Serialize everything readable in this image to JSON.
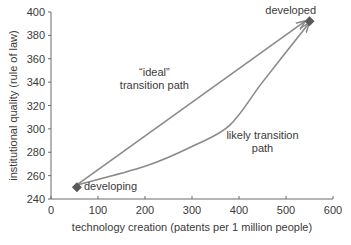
{
  "chart_data": {
    "type": "line",
    "title": "",
    "xlabel": "technology creation (patents per 1 million people)",
    "ylabel": "institutional quality (rule of law)",
    "xlim": [
      0,
      600
    ],
    "ylim": [
      240,
      400
    ],
    "x_ticks": [
      0,
      100,
      200,
      300,
      400,
      500,
      600
    ],
    "y_ticks": [
      240,
      260,
      280,
      300,
      320,
      340,
      360,
      380,
      400
    ],
    "grid": false,
    "legend": null,
    "points": [
      {
        "name": "developing",
        "x": 55,
        "y": 250
      },
      {
        "name": "developed",
        "x": 550,
        "y": 392
      }
    ],
    "series": [
      {
        "name": "“ideal” transition path",
        "style": "straight arrow",
        "x": [
          55,
          540
        ],
        "y": [
          252,
          392
        ]
      },
      {
        "name": "likely transition path",
        "style": "curved arrow",
        "x": [
          55,
          200,
          300,
          380,
          450,
          548
        ],
        "y": [
          252,
          268,
          285,
          303,
          340,
          390
        ]
      }
    ],
    "annotations": [
      {
        "text": "“ideal”",
        "x": 220,
        "y": 345
      },
      {
        "text": "transition path",
        "x": 220,
        "y": 334
      },
      {
        "text": "likely transition",
        "x": 450,
        "y": 291
      },
      {
        "text": "path",
        "x": 450,
        "y": 280
      },
      {
        "text": "developing",
        "x": 70,
        "y": 248
      },
      {
        "text": "developed",
        "x": 510,
        "y": 398
      }
    ],
    "colors": {
      "line": "#8a8a8a",
      "marker": "#5a5a5a",
      "axis": "#6a6a6a",
      "text": "#3a3a3a"
    }
  }
}
